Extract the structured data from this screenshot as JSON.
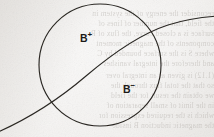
{
  "figure": {
    "name": "magnetic-field-region-diagram",
    "background_color": "#f2f0ee",
    "ink_color": "#2a2723",
    "labels": [
      {
        "id": "b-plus",
        "base": "B",
        "sign": "+",
        "x": 80,
        "y": 31
      },
      {
        "id": "b-minus",
        "base": "B",
        "sign": "−",
        "x": 123,
        "y": 82
      }
    ],
    "shapes": {
      "circle": {
        "cx": 100,
        "cy": 65,
        "r": 61,
        "stroke": "#2a2723",
        "stroke_width": 1.1
      },
      "curve": {
        "description": "monotonically rising curve crossing the circle from lower-left to upper-right",
        "path": "M -4 133 C 30 118, 58 100, 86 76 C 112 54, 140 34, 168 25 C 186 19, 202 17, 218 16",
        "stroke": "#2a2723",
        "stroke_width": 1.1,
        "intersections": [
          {
            "x": 53,
            "y": 103
          },
          {
            "x": 155,
            "y": 30
          }
        ]
      }
    },
    "bleed_through_text": [
      {
        "y": 14,
        "x": 2,
        "text": "reconsider the energy of the system in"
      },
      {
        "y": 24,
        "x": 6,
        "text": "the field, that the number of lines of"
      },
      {
        "y": 34,
        "x": 1,
        "text": "surface is a closed curve, the flux of B"
      },
      {
        "y": 44,
        "x": 8,
        "text": "components of the magnetic moment"
      },
      {
        "y": 54,
        "x": 3,
        "text": "where S is the surface bounded by C"
      },
      {
        "y": 64,
        "x": 12,
        "text": "and therefore the integral vanishes"
      },
      {
        "y": 76,
        "x": 2,
        "text": "(1.12) is given as an integral over"
      },
      {
        "y": 86,
        "x": 9,
        "text": "so that the total flux through the"
      },
      {
        "y": 96,
        "x": 4,
        "text": "we obtain the result for the field"
      },
      {
        "y": 106,
        "x": 7,
        "text": "in the limit of small separation of"
      },
      {
        "y": 116,
        "x": 2,
        "text": "which is the required expression for"
      },
      {
        "y": 126,
        "x": 10,
        "text": "the magnetic induction B inside"
      }
    ]
  }
}
